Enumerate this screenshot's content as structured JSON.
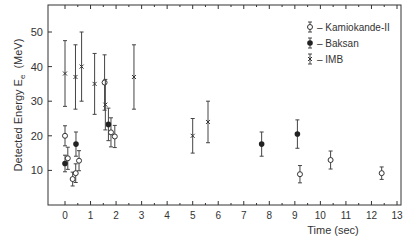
{
  "chart_data": {
    "type": "scatter",
    "title": "",
    "xlabel": "Time  (sec)",
    "ylabel": "Detected Energy  E",
    "ylabel_sub": "e",
    "ylabel_unit": "(MeV)",
    "xlim": [
      -0.6,
      13
    ],
    "ylim": [
      0,
      55
    ],
    "xticks": [
      0,
      1,
      2,
      3,
      4,
      5,
      6,
      7,
      8,
      9,
      10,
      11,
      12,
      13
    ],
    "yticks": [
      10,
      20,
      30,
      40,
      50
    ],
    "grid": false,
    "legend_position": "upper right",
    "series": [
      {
        "name": "Kamiokande-II",
        "marker": "open-circle",
        "points": [
          {
            "x": 0.0,
            "y": 20.0,
            "err": 2.9
          },
          {
            "x": 0.11,
            "y": 13.5,
            "err": 3.2
          },
          {
            "x": 0.3,
            "y": 7.5,
            "err": 2.0
          },
          {
            "x": 0.42,
            "y": 9.2,
            "err": 2.7
          },
          {
            "x": 0.55,
            "y": 12.8,
            "err": 2.9
          },
          {
            "x": 1.55,
            "y": 35.4,
            "err": 8.0
          },
          {
            "x": 1.8,
            "y": 21.0,
            "err": 4.2
          },
          {
            "x": 1.95,
            "y": 19.8,
            "err": 3.2
          },
          {
            "x": 9.2,
            "y": 8.9,
            "err": 2.5
          },
          {
            "x": 10.4,
            "y": 13.0,
            "err": 2.6
          },
          {
            "x": 12.4,
            "y": 9.2,
            "err": 1.8
          }
        ]
      },
      {
        "name": "Baksan",
        "marker": "filled-circle",
        "points": [
          {
            "x": 0.0,
            "y": 12.0,
            "err": 2.4
          },
          {
            "x": 0.43,
            "y": 17.6,
            "err": 3.5
          },
          {
            "x": 1.7,
            "y": 23.3,
            "err": 4.7
          },
          {
            "x": 7.7,
            "y": 17.6,
            "err": 3.5
          },
          {
            "x": 9.1,
            "y": 20.5,
            "err": 4.1
          }
        ]
      },
      {
        "name": "IMB",
        "marker": "x",
        "points": [
          {
            "x": 0.0,
            "y": 38.0,
            "err": 9.5
          },
          {
            "x": 0.41,
            "y": 37.0,
            "err": 9.3
          },
          {
            "x": 0.65,
            "y": 40.0,
            "err": 10.0
          },
          {
            "x": 1.16,
            "y": 35.0,
            "err": 8.8
          },
          {
            "x": 1.58,
            "y": 29.0,
            "err": 7.3
          },
          {
            "x": 2.7,
            "y": 37.0,
            "err": 9.3
          },
          {
            "x": 5.0,
            "y": 20.0,
            "err": 5.0
          },
          {
            "x": 5.6,
            "y": 24.0,
            "err": 6.0
          }
        ]
      }
    ]
  }
}
